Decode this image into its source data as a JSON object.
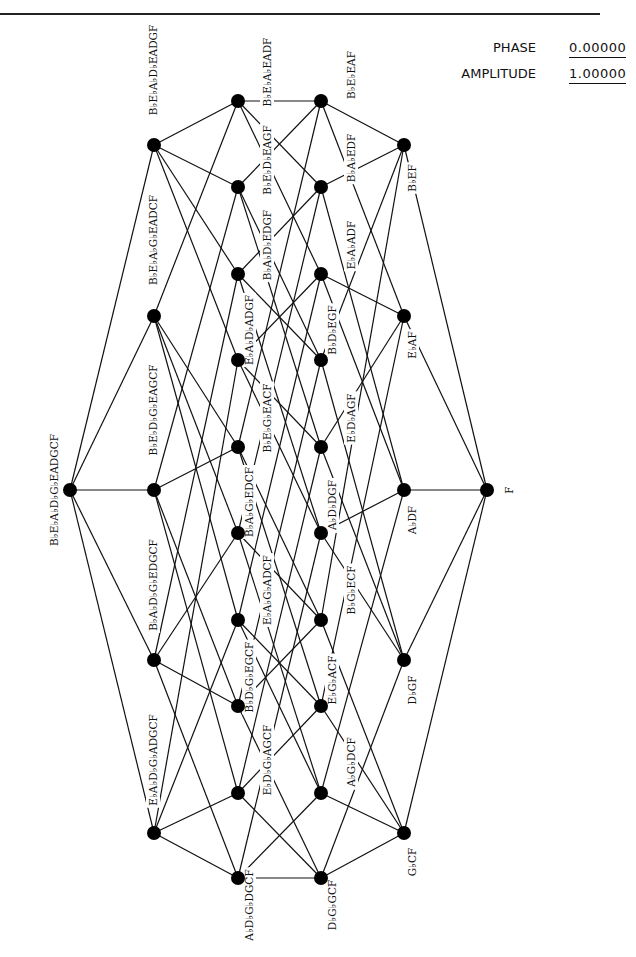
{
  "header": {
    "phase_label": "PHASE",
    "phase_value": "0.00000",
    "amplitude_label": "AMPLITUDE",
    "amplitude_value": "1.00000"
  },
  "diagram": {
    "type": "hasse-lattice",
    "node_color": "#000000",
    "edge_color": "#111111",
    "levels": [
      {
        "x": 70,
        "nodes": [
          {
            "y": 490,
            "set": [
              "Bb",
              "Eb",
              "Ab",
              "Db",
              "Gb"
            ],
            "label": "BbEbAbDbGbEADGCF"
          }
        ]
      },
      {
        "x": 154,
        "nodes": [
          {
            "y": 145,
            "set": [
              "Bb",
              "Eb",
              "Ab",
              "Db"
            ],
            "label": "BbEbAbDbEADGF"
          },
          {
            "y": 316,
            "set": [
              "Bb",
              "Eb",
              "Ab",
              "Gb"
            ],
            "label": "BbEbAbGbEADCF"
          },
          {
            "y": 490,
            "set": [
              "Bb",
              "Eb",
              "Db",
              "Gb"
            ],
            "label": "BbEbDbGbEAGCF"
          },
          {
            "y": 660,
            "set": [
              "Bb",
              "Ab",
              "Db",
              "Gb"
            ],
            "label": "BbAbDbGbEDGCF"
          },
          {
            "y": 833,
            "set": [
              "Eb",
              "Ab",
              "Db",
              "Gb"
            ],
            "label": "EbAbDbGbADGCF"
          }
        ]
      },
      {
        "x": 238,
        "nodes": [
          {
            "y": 101,
            "set": [
              "Bb",
              "Eb",
              "Ab"
            ],
            "label": "BbEbAbEADF"
          },
          {
            "y": 187,
            "set": [
              "Bb",
              "Eb",
              "Db"
            ],
            "label": "BbEbDbEAGF"
          },
          {
            "y": 274,
            "set": [
              "Bb",
              "Ab",
              "Db"
            ],
            "label": "BbAbDbEDGF"
          },
          {
            "y": 360,
            "set": [
              "Eb",
              "Ab",
              "Db"
            ],
            "label": "EbAbDbADGF"
          },
          {
            "y": 447,
            "set": [
              "Bb",
              "Eb",
              "Gb"
            ],
            "label": "BbEbGbEACF"
          },
          {
            "y": 533,
            "set": [
              "Bb",
              "Ab",
              "Gb"
            ],
            "label": "BbAbGbEDCF"
          },
          {
            "y": 620,
            "set": [
              "Eb",
              "Ab",
              "Gb"
            ],
            "label": "EbAbGbADCF"
          },
          {
            "y": 706,
            "set": [
              "Bb",
              "Db",
              "Gb"
            ],
            "label": "BbDbGbEGCF"
          },
          {
            "y": 793,
            "set": [
              "Eb",
              "Db",
              "Gb"
            ],
            "label": "EbDbGbAGCF"
          },
          {
            "y": 878,
            "set": [
              "Ab",
              "Db",
              "Gb"
            ],
            "label": "AbDbGbDGCF"
          }
        ]
      },
      {
        "x": 321,
        "nodes": [
          {
            "y": 101,
            "set": [
              "Bb",
              "Eb"
            ],
            "label": "BbEbEAF"
          },
          {
            "y": 187,
            "set": [
              "Bb",
              "Ab"
            ],
            "label": "BbAbEDF"
          },
          {
            "y": 274,
            "set": [
              "Eb",
              "Ab"
            ],
            "label": "EbAbADF"
          },
          {
            "y": 360,
            "set": [
              "Bb",
              "Db"
            ],
            "label": "BbDbEGF"
          },
          {
            "y": 447,
            "set": [
              "Eb",
              "Db"
            ],
            "label": "EbDbAGF"
          },
          {
            "y": 533,
            "set": [
              "Ab",
              "Db"
            ],
            "label": "AbDbDGF"
          },
          {
            "y": 620,
            "set": [
              "Bb",
              "Gb"
            ],
            "label": "BbGbECF"
          },
          {
            "y": 706,
            "set": [
              "Eb",
              "Gb"
            ],
            "label": "EbGbACF"
          },
          {
            "y": 793,
            "set": [
              "Ab",
              "Gb"
            ],
            "label": "AbGbDCF"
          },
          {
            "y": 878,
            "set": [
              "Db",
              "Gb"
            ],
            "label": "DbGbGCF"
          }
        ]
      },
      {
        "x": 404,
        "nodes": [
          {
            "y": 145,
            "set": [
              "Bb"
            ],
            "label": "BbEF"
          },
          {
            "y": 316,
            "set": [
              "Eb"
            ],
            "label": "EbAF"
          },
          {
            "y": 490,
            "set": [
              "Ab"
            ],
            "label": "AbDF"
          },
          {
            "y": 660,
            "set": [
              "Db"
            ],
            "label": "DbGF"
          },
          {
            "y": 833,
            "set": [
              "Gb"
            ],
            "label": "GbCF"
          }
        ]
      },
      {
        "x": 487,
        "nodes": [
          {
            "y": 490,
            "set": [],
            "label": "F"
          }
        ]
      }
    ],
    "label_positions": {
      "0-0": [
        55,
        490
      ],
      "1-0": [
        154,
        70
      ],
      "1-1": [
        154,
        240
      ],
      "1-2": [
        154,
        410
      ],
      "1-3": [
        154,
        585
      ],
      "1-4": [
        154,
        760
      ],
      "2-0": [
        268,
        72
      ],
      "2-1": [
        268,
        160
      ],
      "2-2": [
        268,
        245
      ],
      "2-3": [
        250,
        330
      ],
      "2-4": [
        268,
        418
      ],
      "2-5": [
        250,
        502
      ],
      "2-6": [
        268,
        590
      ],
      "2-7": [
        250,
        677
      ],
      "2-8": [
        268,
        760
      ],
      "2-9": [
        250,
        905
      ],
      "3-0": [
        352,
        75
      ],
      "3-1": [
        352,
        158
      ],
      "3-2": [
        352,
        245
      ],
      "3-3": [
        333,
        330
      ],
      "3-4": [
        352,
        418
      ],
      "3-5": [
        333,
        505
      ],
      "3-6": [
        352,
        590
      ],
      "3-7": [
        333,
        680
      ],
      "3-8": [
        352,
        762
      ],
      "3-9": [
        333,
        905
      ],
      "4-0": [
        413,
        178
      ],
      "4-1": [
        413,
        345
      ],
      "4-2": [
        413,
        520
      ],
      "4-3": [
        413,
        690
      ],
      "4-4": [
        413,
        862
      ],
      "5-0": [
        510,
        490
      ]
    }
  }
}
